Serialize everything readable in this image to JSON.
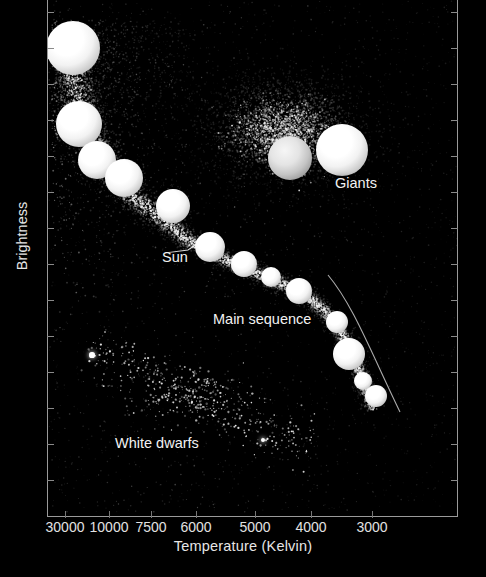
{
  "chart_data": {
    "type": "scatter",
    "title": "",
    "xlabel": "Temperature (Kelvin)",
    "ylabel": "Brightness",
    "x_tick_labels": [
      "30000",
      "10000",
      "7500",
      "6000",
      "5000",
      "4000",
      "3000"
    ],
    "x_axis_inverted": true,
    "y_tick_labels": [],
    "grid": false,
    "legend_position": "none",
    "background_color": "#000000",
    "star_color": "#ffffff",
    "annotations": [
      {
        "label": "Giants",
        "x_px": 334,
        "y_px": 184
      },
      {
        "label": "Sun",
        "x_px": 161,
        "y_px": 258
      },
      {
        "label": "Main sequence",
        "x_px": 212,
        "y_px": 320
      },
      {
        "label": "White dwarfs",
        "x_px": 114,
        "y_px": 444
      }
    ],
    "series": [
      {
        "name": "Main sequence (highlighted stars)",
        "points": [
          {
            "x_px": 72,
            "y_px": 48,
            "r_px": 13.5,
            "class": "big"
          },
          {
            "x_px": 78,
            "y_px": 124,
            "r_px": 11.5,
            "class": "big"
          },
          {
            "x_px": 96,
            "y_px": 160,
            "r_px": 9.5,
            "class": "big"
          },
          {
            "x_px": 123,
            "y_px": 178,
            "r_px": 9.5,
            "class": "big"
          },
          {
            "x_px": 172,
            "y_px": 206,
            "r_px": 8.5,
            "class": "big"
          },
          {
            "x_px": 209,
            "y_px": 247,
            "r_px": 7.5,
            "class": "big"
          },
          {
            "x_px": 243,
            "y_px": 264,
            "r_px": 6.5,
            "class": "big"
          },
          {
            "x_px": 270,
            "y_px": 277,
            "r_px": 5.0,
            "class": "big"
          },
          {
            "x_px": 298,
            "y_px": 291,
            "r_px": 6.5,
            "class": "big"
          },
          {
            "x_px": 336,
            "y_px": 322,
            "r_px": 5.5,
            "class": "big"
          },
          {
            "x_px": 348,
            "y_px": 354,
            "r_px": 8.0,
            "class": "big"
          },
          {
            "x_px": 362,
            "y_px": 381,
            "r_px": 4.5,
            "class": "big"
          },
          {
            "x_px": 375,
            "y_px": 396,
            "r_px": 5.5,
            "class": "big"
          }
        ]
      },
      {
        "name": "Giants (highlighted stars)",
        "points": [
          {
            "x_px": 289,
            "y_px": 158,
            "r_px": 11.0,
            "class": "dim"
          },
          {
            "x_px": 341,
            "y_px": 150,
            "r_px": 13.0,
            "class": "big"
          }
        ]
      },
      {
        "name": "White dwarfs (highlighted stars)",
        "points": [
          {
            "x_px": 91,
            "y_px": 355,
            "r_px": 2.6
          },
          {
            "x_px": 262,
            "y_px": 440,
            "r_px": 2.2
          }
        ]
      }
    ]
  },
  "axes": {
    "xlabel": "Temperature (Kelvin)",
    "ylabel": "Brightness",
    "x_ticks": [
      {
        "label": "30000",
        "left_px": 65
      },
      {
        "label": "10000",
        "left_px": 109
      },
      {
        "label": "7500",
        "left_px": 151
      },
      {
        "label": "6000",
        "left_px": 196
      },
      {
        "label": "5000",
        "left_px": 255
      },
      {
        "label": "4000",
        "left_px": 311
      },
      {
        "label": "3000",
        "left_px": 372
      }
    ]
  },
  "annotations": {
    "giants": "Giants",
    "sun": "Sun",
    "main_sequence": "Main sequence",
    "white_dwarfs": "White dwarfs"
  }
}
